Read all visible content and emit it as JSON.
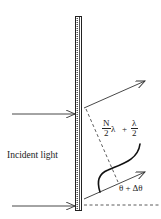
{
  "diagram": {
    "labels": {
      "incident_light": "Incident light",
      "angle": "θ + Δθ",
      "path_difference": {
        "term1_numerator": "N",
        "term1_denominator": "2",
        "term1_symbol": "λ",
        "operator": "+",
        "term2_numerator": "λ",
        "term2_denominator": "2"
      }
    },
    "elements": [
      {
        "id": "grating",
        "type": "vertical-grating",
        "x": [
          75,
          82
        ],
        "y": [
          16,
          210
        ]
      },
      {
        "id": "incident-ray-top",
        "type": "arrow",
        "from": [
          12,
          114
        ],
        "to": [
          75,
          114
        ]
      },
      {
        "id": "incident-ray-bottom",
        "type": "arrow",
        "from": [
          12,
          206
        ],
        "to": [
          75,
          206
        ]
      },
      {
        "id": "diffracted-ray-top",
        "type": "arrow",
        "from": [
          84,
          108
        ],
        "to": [
          145,
          81
        ]
      },
      {
        "id": "diffracted-ray-bottom",
        "type": "arrow",
        "from": [
          84,
          199
        ],
        "to": [
          145,
          172
        ]
      },
      {
        "id": "wavefront-normal",
        "type": "dashed-line",
        "from": [
          86,
          109
        ],
        "to": [
          118,
          182
        ]
      },
      {
        "id": "grating-normal",
        "type": "dashed-line",
        "from": [
          84,
          205
        ],
        "to": [
          161,
          205
        ]
      },
      {
        "id": "wave-curve",
        "type": "curve",
        "from": [
          100,
          192
        ],
        "to": [
          141,
          143
        ]
      }
    ],
    "colors": {
      "stroke": "#333333",
      "background": "#ffffff"
    }
  }
}
